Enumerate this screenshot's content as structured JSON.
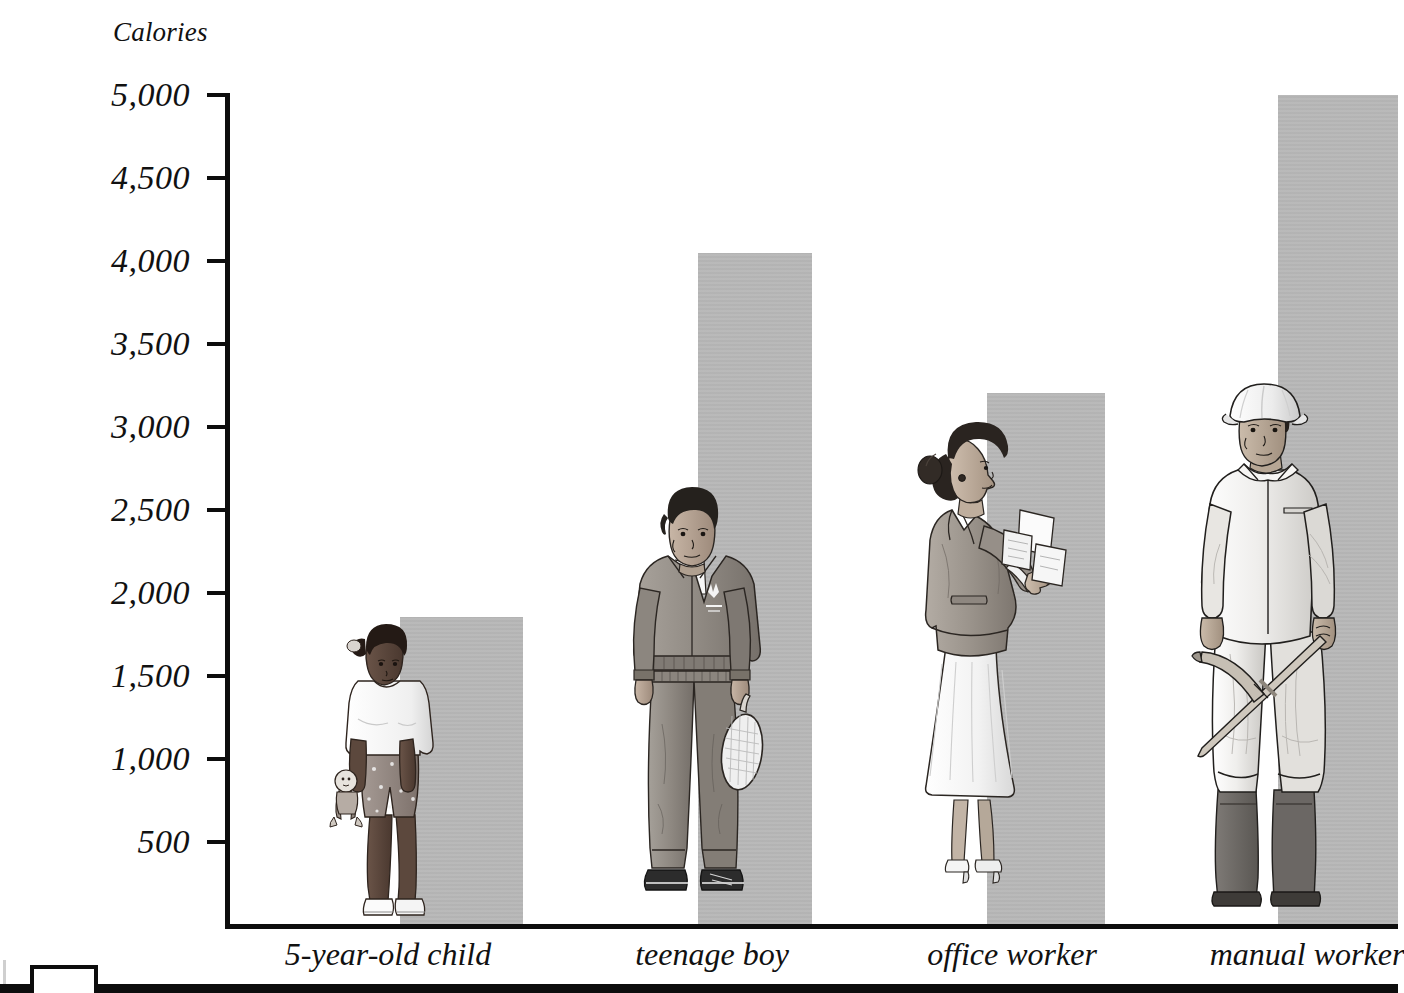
{
  "axis": {
    "y_title": "Calories",
    "y_ticks": [
      "5,000",
      "4,500",
      "4,000",
      "3,500",
      "3,000",
      "2,500",
      "2,000",
      "1,500",
      "1,000",
      "500"
    ]
  },
  "categories": [
    "5-year-old child",
    "teenage boy",
    "office worker",
    "manual worker"
  ],
  "colors": {
    "bar_fill": "#b7b7b7",
    "axis_ink": "#0d0d0d",
    "text_ink": "#111111",
    "paper": "#ffffff"
  },
  "figures": {
    "child": {
      "name": "5-year-old child",
      "description": "young child standing, white t-shirt, patterned shorts, white sneakers, holding a rag doll"
    },
    "teen": {
      "name": "teenage boy",
      "description": "teenage boy in grey tracksuit with logo, dark trainers, holding a tennis racket"
    },
    "office": {
      "name": "office worker",
      "description": "woman in profile with hair bun, grey blazer, white skirt, heels, pinning papers to a board"
    },
    "manual": {
      "name": "manual worker",
      "description": "man in white hard hat and light coveralls with dark rubber boots, holding a pickaxe"
    }
  },
  "chart_data": {
    "type": "bar",
    "title": "",
    "xlabel": "",
    "ylabel": "Calories",
    "categories": [
      "5-year-old child",
      "teenage boy",
      "office worker",
      "manual worker"
    ],
    "values": [
      1850,
      4050,
      3200,
      5000
    ],
    "ylim": [
      0,
      5000
    ],
    "ytick_values": [
      500,
      1000,
      1500,
      2000,
      2500,
      3000,
      3500,
      4000,
      4500,
      5000
    ],
    "ytick_labels": [
      "500",
      "1,000",
      "1,500",
      "2,000",
      "2,500",
      "3,000",
      "3,500",
      "4,000",
      "4,500",
      "5,000"
    ],
    "grid": false,
    "legend": false,
    "series": [
      {
        "name": "Daily calorie requirement",
        "values": [
          1850,
          4050,
          3200,
          5000
        ]
      }
    ]
  }
}
